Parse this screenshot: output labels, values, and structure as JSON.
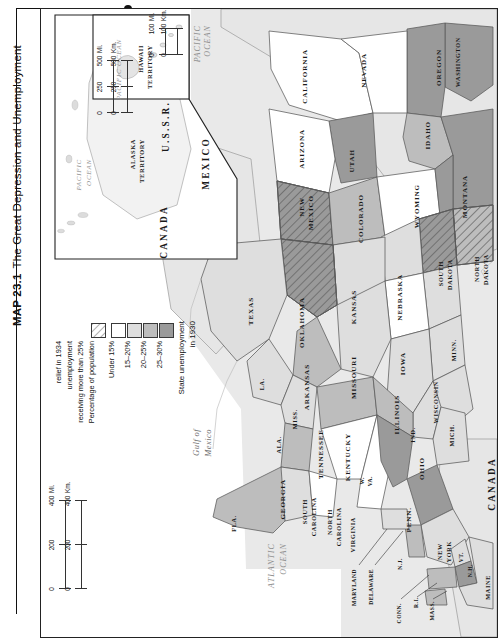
{
  "caption": {
    "number": "MAP 23.1",
    "title": "The Great Depression and Unemployment"
  },
  "legend": {
    "title_line1": "State unemployment",
    "title_line2": "in 1930",
    "items": [
      {
        "label": "25–30%",
        "swatch": "#9a9a9a"
      },
      {
        "label": "20–25%",
        "swatch": "#bdbdbd"
      },
      {
        "label": "15–20%",
        "swatch": "#dedede"
      },
      {
        "label": "Under 15%",
        "swatch": "#ffffff"
      }
    ],
    "hatch_item": {
      "label_line1": "Percentage of population",
      "label_line2": "receiving more than 25%",
      "label_line3": "unemployment",
      "label_line4": "relief in 1934",
      "swatch": "hatch"
    }
  },
  "scales": {
    "main_km": {
      "ticks": [
        "0",
        "200",
        "400"
      ],
      "unit": "Km."
    },
    "main_mi": {
      "ticks": [
        "0",
        "200",
        "400"
      ],
      "unit": "Mi."
    },
    "alaska_km": {
      "ticks": [
        "0",
        "250",
        "500"
      ],
      "unit": "Km."
    },
    "alaska_mi": {
      "ticks": [
        "0",
        "250",
        "500"
      ],
      "unit": "Mi."
    },
    "hawaii_km": {
      "ticks": [
        "0",
        "100"
      ],
      "unit": "Km."
    },
    "hawaii_mi": {
      "ticks": [
        "0",
        "100"
      ],
      "unit": "Mi."
    }
  },
  "insets": {
    "hawaii": {
      "title_line1": "HAWAII",
      "title_line2": "TERRITORY",
      "ocean": "PACIFIC OCEAN"
    },
    "alaska": {
      "title_line1": "ALASKA",
      "title_line2": "TERRITORY",
      "ocean_line1": "PACIFIC",
      "ocean_line2": "OCEAN"
    }
  },
  "countries": [
    {
      "name": "U.S.S.R.",
      "x": 119,
      "y": 96
    },
    {
      "name": "CANADA",
      "x": 117,
      "y": 227
    },
    {
      "name": "MEXICO",
      "x": 160,
      "y": 160
    },
    {
      "name": "CANADA",
      "x": 446,
      "y": 478
    }
  ],
  "oceans": [
    {
      "name": "PACIFIC\nOCEAN",
      "x": 149,
      "y": 20
    },
    {
      "name": "ATLANTIC\nOCEAN",
      "x": 230,
      "y": 556
    },
    {
      "name": "Gulf of\nMexico",
      "x": 152,
      "y": 443
    }
  ],
  "map_data": {
    "type": "choropleth",
    "title": "The Great Depression and Unemployment",
    "value_label": "State unemployment in 1930",
    "overlay_label": "Percentage of population receiving more than 25% unemployment relief in 1934",
    "classes": [
      "25–30%",
      "20–25%",
      "15–20%",
      "Under 15%"
    ],
    "states": [
      {
        "name": "WASHINGTON",
        "class": "25–30%",
        "hatched": false
      },
      {
        "name": "OREGON",
        "class": "25–30%",
        "hatched": false
      },
      {
        "name": "CALIFORNIA",
        "class": "Under 15%",
        "hatched": false
      },
      {
        "name": "NEVADA",
        "class": "Under 15%",
        "hatched": false
      },
      {
        "name": "IDAHO",
        "class": "20–25%",
        "hatched": false
      },
      {
        "name": "MONTANA",
        "class": "25–30%",
        "hatched": false
      },
      {
        "name": "UTAH",
        "class": "25–30%",
        "hatched": false
      },
      {
        "name": "ARIZONA",
        "class": "Under 15%",
        "hatched": false
      },
      {
        "name": "NEW MEXICO",
        "class": "25–30%",
        "hatched": true
      },
      {
        "name": "COLORADO",
        "class": "20–25%",
        "hatched": false
      },
      {
        "name": "WYOMING",
        "class": "Under 15%",
        "hatched": false
      },
      {
        "name": "NORTH DAKOTA",
        "class": "20–25%",
        "hatched": true
      },
      {
        "name": "SOUTH DAKOTA",
        "class": "25–30%",
        "hatched": true
      },
      {
        "name": "NEBRASKA",
        "class": "15–20%",
        "hatched": false
      },
      {
        "name": "KANSAS",
        "class": "15–20%",
        "hatched": false
      },
      {
        "name": "OKLAHOMA",
        "class": "25–30%",
        "hatched": true
      },
      {
        "name": "TEXAS",
        "class": "15–20%",
        "hatched": false
      },
      {
        "name": "MINN.",
        "class": "15–20%",
        "hatched": false
      },
      {
        "name": "IOWA",
        "class": "Under 15%",
        "hatched": false
      },
      {
        "name": "MISSOURI",
        "class": "15–20%",
        "hatched": false
      },
      {
        "name": "ARKANSAS",
        "class": "20–25%",
        "hatched": false
      },
      {
        "name": "LA.",
        "class": "15–20%",
        "hatched": false
      },
      {
        "name": "WISCONSIN",
        "class": "15–20%",
        "hatched": false
      },
      {
        "name": "ILLINOIS",
        "class": "15–20%",
        "hatched": false
      },
      {
        "name": "MICH.",
        "class": "15–20%",
        "hatched": false
      },
      {
        "name": "IND.",
        "class": "15–20%",
        "hatched": false
      },
      {
        "name": "OHIO",
        "class": "15–20%",
        "hatched": false
      },
      {
        "name": "MISS.",
        "class": "15–20%",
        "hatched": false
      },
      {
        "name": "ALA.",
        "class": "20–25%",
        "hatched": false
      },
      {
        "name": "TENNESSEE",
        "class": "20–25%",
        "hatched": false
      },
      {
        "name": "KENTUCKY",
        "class": "20–25%",
        "hatched": false
      },
      {
        "name": "GEORGIA",
        "class": "15–20%",
        "hatched": false
      },
      {
        "name": "FLA.",
        "class": "20–25%",
        "hatched": false
      },
      {
        "name": "SOUTH CAROLINA",
        "class": "Under 15%",
        "hatched": false
      },
      {
        "name": "NORTH CAROLINA",
        "class": "Under 15%",
        "hatched": false
      },
      {
        "name": "VIRGINIA",
        "class": "Under 15%",
        "hatched": false
      },
      {
        "name": "W. VA.",
        "class": "25–30%",
        "hatched": false
      },
      {
        "name": "PENN.",
        "class": "25–30%",
        "hatched": false
      },
      {
        "name": "NEW YORK",
        "class": "15–20%",
        "hatched": false
      },
      {
        "name": "N.J.",
        "class": "20–25%",
        "hatched": false
      },
      {
        "name": "MARYLAND",
        "class": "15–20%",
        "hatched": false
      },
      {
        "name": "DELAWARE",
        "class": "15–20%",
        "hatched": false
      },
      {
        "name": "CONN.",
        "class": "20–25%",
        "hatched": false
      },
      {
        "name": "R.I.",
        "class": "20–25%",
        "hatched": false
      },
      {
        "name": "MASS.",
        "class": "20–25%",
        "hatched": false
      },
      {
        "name": "VT.",
        "class": "15–20%",
        "hatched": false
      },
      {
        "name": "N.H.",
        "class": "25–30%",
        "hatched": false
      },
      {
        "name": "MAINE",
        "class": "15–20%",
        "hatched": false
      }
    ]
  },
  "state_labels": [
    {
      "name": "WASHINGTON",
      "x": 413,
      "y": 28,
      "cls": "state sm"
    },
    {
      "name": "OREGON",
      "x": 394,
      "y": 40,
      "cls": "state"
    },
    {
      "name": "CALIFORNIA",
      "x": 260,
      "y": 40,
      "cls": "state"
    },
    {
      "name": "NEVADA",
      "x": 319,
      "y": 44,
      "cls": "state"
    },
    {
      "name": "IDAHO",
      "x": 383,
      "y": 112,
      "cls": "state"
    },
    {
      "name": "MONTANA",
      "x": 420,
      "y": 166,
      "cls": "state"
    },
    {
      "name": "UTAH",
      "x": 307,
      "y": 140,
      "cls": "state"
    },
    {
      "name": "ARIZONA",
      "x": 257,
      "y": 120,
      "cls": "state"
    },
    {
      "name": "NEW",
      "x": 257,
      "y": 188,
      "cls": "state"
    },
    {
      "name": "MEXICO",
      "x": 266,
      "y": 186,
      "cls": "state"
    },
    {
      "name": "COLORADO",
      "x": 316,
      "y": 185,
      "cls": "state"
    },
    {
      "name": "WYOMING",
      "x": 372,
      "y": 175,
      "cls": "state"
    },
    {
      "name": "NORTH",
      "x": 432,
      "y": 247,
      "cls": "state sm"
    },
    {
      "name": "DAKOTA",
      "x": 441,
      "y": 245,
      "cls": "state sm"
    },
    {
      "name": "SOUTH",
      "x": 396,
      "y": 252,
      "cls": "state sm"
    },
    {
      "name": "DAKOTA",
      "x": 405,
      "y": 250,
      "cls": "state sm"
    },
    {
      "name": "NEBRASKA",
      "x": 355,
      "y": 265,
      "cls": "state"
    },
    {
      "name": "KANSAS",
      "x": 309,
      "y": 281,
      "cls": "state"
    },
    {
      "name": "OKLAHOMA",
      "x": 257,
      "y": 288,
      "cls": "state"
    },
    {
      "name": "TEXAS",
      "x": 206,
      "y": 288,
      "cls": "state"
    },
    {
      "name": "MINN.",
      "x": 409,
      "y": 330,
      "cls": "state sm"
    },
    {
      "name": "IOWA",
      "x": 358,
      "y": 343,
      "cls": "state"
    },
    {
      "name": "MISSOURI",
      "x": 309,
      "y": 347,
      "cls": "state"
    },
    {
      "name": "ARKANSAS",
      "x": 262,
      "y": 355,
      "cls": "state"
    },
    {
      "name": "LA.",
      "x": 217,
      "y": 369,
      "cls": "state sm"
    },
    {
      "name": "WISCONSIN",
      "x": 391,
      "y": 372,
      "cls": "state sm"
    },
    {
      "name": "ILLINOIS",
      "x": 352,
      "y": 386,
      "cls": "state"
    },
    {
      "name": "MICH.",
      "x": 407,
      "y": 415,
      "cls": "state sm"
    },
    {
      "name": "IND.",
      "x": 368,
      "y": 418,
      "cls": "state sm"
    },
    {
      "name": "OHIO",
      "x": 377,
      "y": 448,
      "cls": "state"
    },
    {
      "name": "MISS.",
      "x": 250,
      "y": 400,
      "cls": "state sm"
    },
    {
      "name": "ALA.",
      "x": 234,
      "y": 427,
      "cls": "state sm"
    },
    {
      "name": "TENNESSEE",
      "x": 276,
      "y": 420,
      "cls": "state"
    },
    {
      "name": "KENTUCKY",
      "x": 303,
      "y": 424,
      "cls": "state"
    },
    {
      "name": "GEORGIA",
      "x": 238,
      "y": 470,
      "cls": "state"
    },
    {
      "name": "FLA.",
      "x": 189,
      "y": 506,
      "cls": "state sm"
    },
    {
      "name": "SOUTH",
      "x": 260,
      "y": 490,
      "cls": "state sm"
    },
    {
      "name": "CAROLINA",
      "x": 269,
      "y": 488,
      "cls": "state sm"
    },
    {
      "name": "NORTH",
      "x": 285,
      "y": 500,
      "cls": "state sm"
    },
    {
      "name": "CAROLINA",
      "x": 294,
      "y": 498,
      "cls": "state sm"
    },
    {
      "name": "VIRGINIA",
      "x": 308,
      "y": 508,
      "cls": "state sm"
    },
    {
      "name": "W.",
      "x": 318,
      "y": 468,
      "cls": "state tiny"
    },
    {
      "name": "VA.",
      "x": 326,
      "y": 467,
      "cls": "state tiny"
    },
    {
      "name": "PENN.",
      "x": 364,
      "y": 498,
      "cls": "state"
    },
    {
      "name": "NEW",
      "x": 395,
      "y": 534,
      "cls": "state sm"
    },
    {
      "name": "YORK",
      "x": 404,
      "y": 532,
      "cls": "state sm"
    },
    {
      "name": "N.J.",
      "x": 356,
      "y": 549,
      "cls": "state tiny"
    },
    {
      "name": "MARYLAND",
      "x": 310,
      "y": 560,
      "cls": "state tiny"
    },
    {
      "name": "DELAWARE",
      "x": 327,
      "y": 560,
      "cls": "state tiny"
    },
    {
      "name": "CONN.",
      "x": 355,
      "y": 594,
      "cls": "state tiny"
    },
    {
      "name": "R.I.",
      "x": 372,
      "y": 588,
      "cls": "state tiny"
    },
    {
      "name": "MASS.",
      "x": 388,
      "y": 592,
      "cls": "state tiny"
    },
    {
      "name": "VT.",
      "x": 417,
      "y": 543,
      "cls": "state tiny"
    },
    {
      "name": "N.H.",
      "x": 426,
      "y": 555,
      "cls": "state tiny"
    },
    {
      "name": "MAINE",
      "x": 443,
      "y": 566,
      "cls": "state sm"
    }
  ]
}
